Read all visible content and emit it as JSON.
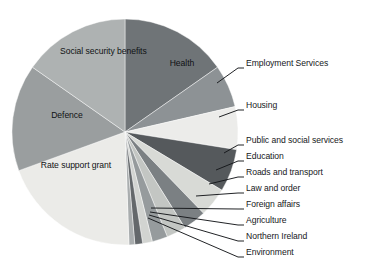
{
  "chart_data": {
    "type": "pie",
    "title": "",
    "subtitle": "",
    "xlabel": "",
    "ylabel": "",
    "legend_position": "none",
    "grid": false,
    "start_angle_deg": 0,
    "direction": "clockwise",
    "center": {
      "x": 125,
      "y": 132
    },
    "radius": 113,
    "categories": [
      "Health",
      "Employment Services",
      "Housing",
      "Public and social services",
      "Education",
      "Roads and transport",
      "Law and order",
      "Foreign affairs",
      "Agriculture",
      "Northern Ireland",
      "Environment",
      "Rate support grant",
      "Defence",
      "Social security benefits"
    ],
    "values": [
      15.3,
      6.1,
      6.1,
      6.1,
      4.2,
      3.3,
      2.8,
      2.2,
      1.4,
      1.1,
      0.8,
      20.0,
      15.3,
      15.3
    ],
    "slices": [
      {
        "label": "Health",
        "value": 15.3,
        "angle_deg": 55.0,
        "color": "#6f7477",
        "label_mode": "inside"
      },
      {
        "label": "Employment Services",
        "value": 6.1,
        "angle_deg": 22.0,
        "color": "#8d9295",
        "label_mode": "callout"
      },
      {
        "label": "Housing",
        "value": 6.1,
        "angle_deg": 22.0,
        "color": "#ececea",
        "label_mode": "callout"
      },
      {
        "label": "Public and social services",
        "value": 6.1,
        "angle_deg": 22.0,
        "color": "#55595c",
        "label_mode": "callout"
      },
      {
        "label": "Education",
        "value": 4.2,
        "angle_deg": 15.0,
        "color": "#d8dad6",
        "label_mode": "callout"
      },
      {
        "label": "Roads and transport",
        "value": 3.3,
        "angle_deg": 12.0,
        "color": "#7b8083",
        "label_mode": "callout"
      },
      {
        "label": "Law and order",
        "value": 2.8,
        "angle_deg": 10.0,
        "color": "#c3c6c3",
        "label_mode": "callout"
      },
      {
        "label": "Foreign affairs",
        "value": 2.2,
        "angle_deg": 8.0,
        "color": "#969b9d",
        "label_mode": "callout"
      },
      {
        "label": "Agriculture",
        "value": 1.4,
        "angle_deg": 5.0,
        "color": "#d2d4d1",
        "label_mode": "callout"
      },
      {
        "label": "Northern Ireland",
        "value": 1.1,
        "angle_deg": 4.0,
        "color": "#64686b",
        "label_mode": "callout"
      },
      {
        "label": "Environment",
        "value": 0.8,
        "angle_deg": 3.0,
        "color": "#a9adae",
        "label_mode": "callout"
      },
      {
        "label": "Rate support grant",
        "value": 20.0,
        "angle_deg": 72.0,
        "color": "#ebebe8",
        "label_mode": "inside"
      },
      {
        "label": "Defence",
        "value": 15.3,
        "angle_deg": 55.0,
        "color": "#9a9e9f",
        "label_mode": "inside"
      },
      {
        "label": "Social security benefits",
        "value": 15.3,
        "angle_deg": 55.0,
        "color": "#aeb2b2",
        "label_mode": "inside"
      }
    ],
    "inside_labels": [
      {
        "name": "health",
        "text": "Health",
        "x": 160,
        "y": 58,
        "width": 44
      },
      {
        "name": "social-security-benefits",
        "text": "Social security benefits",
        "x": 60,
        "y": 46,
        "width": 62
      },
      {
        "name": "defence",
        "text": "Defence",
        "x": 44,
        "y": 110,
        "width": 46
      },
      {
        "name": "rate-support-grant",
        "text": "Rate support grant",
        "x": 32,
        "y": 160,
        "width": 88
      }
    ],
    "callout_labels": [
      {
        "name": "employment-services",
        "text": "Employment Services",
        "text_x": 246,
        "text_y": 63,
        "line": "217,83 238,68 244,68"
      },
      {
        "name": "housing",
        "text": "Housing",
        "text_x": 246,
        "text_y": 105,
        "line": "219,117 238,110 244,110"
      },
      {
        "name": "public-and-social-services",
        "text": "Public and social services",
        "text_x": 246,
        "text_y": 140,
        "line": "224,153 238,145 244,145"
      },
      {
        "name": "education",
        "text": "Education",
        "text_x": 246,
        "text_y": 156,
        "line": "216,170 238,161 244,161"
      },
      {
        "name": "roads-and-transport",
        "text": "Roads and transport",
        "text_x": 246,
        "text_y": 172,
        "line": "209,184 238,177 244,177"
      },
      {
        "name": "law-and-order",
        "text": "Law and order",
        "text_x": 246,
        "text_y": 188,
        "line": "196,196 238,193 244,193"
      },
      {
        "name": "foreign-affairs",
        "text": "Foreign affairs",
        "text_x": 246,
        "text_y": 204,
        "line": "151,208 238,209 244,209"
      },
      {
        "name": "agriculture",
        "text": "Agriculture",
        "text_x": 246,
        "text_y": 220,
        "line": "150,212 238,225 244,225"
      },
      {
        "name": "northern-ireland",
        "text": "Northern Ireland",
        "text_x": 246,
        "text_y": 236,
        "line": "149,215 238,241 244,241"
      },
      {
        "name": "environment",
        "text": "Environment",
        "text_x": 246,
        "text_y": 252,
        "line": "148,218 238,257 244,257"
      }
    ]
  }
}
